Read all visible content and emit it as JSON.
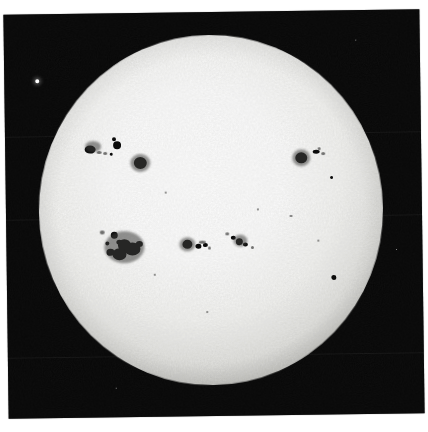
{
  "image": {
    "kind": "photograph",
    "subject": "full solar disk",
    "medium": "black-and-white photographic print",
    "width": 428,
    "height": 432,
    "background_color": "#ffffff",
    "print_color": "#050505",
    "disk_color": "#fbfbf9",
    "spot_color": "#0b0b0b"
  },
  "print": {
    "left": 6,
    "top": 12,
    "width": 416,
    "height": 404,
    "rotation_deg": -0.75,
    "seams": [
      122,
      205,
      343
    ]
  },
  "disk": {
    "center_x": 205,
    "center_y": 198,
    "radius_x": 172,
    "radius_y": 175
  },
  "field_marks": {
    "fiducial": {
      "x": 33,
      "y": 67,
      "label": "bright-reference-point"
    },
    "specks": [
      {
        "x": 352,
        "y": 30
      },
      {
        "x": 390,
        "y": 240
      },
      {
        "x": 108,
        "y": 375
      },
      {
        "x": 60,
        "y": 200
      }
    ]
  },
  "sunspots": {
    "groups": [
      {
        "name": "northwest-group",
        "spots": [
          {
            "x": 85,
            "y": 136,
            "w": 11,
            "h": 8,
            "type": "umbra"
          },
          {
            "x": 94,
            "y": 139,
            "w": 5,
            "h": 3,
            "type": "faint"
          },
          {
            "x": 100,
            "y": 140,
            "w": 4,
            "h": 3,
            "type": "faint"
          },
          {
            "x": 106,
            "y": 141,
            "w": 3,
            "h": 3,
            "type": "umbra"
          },
          {
            "x": 112,
            "y": 132,
            "w": 8,
            "h": 8,
            "type": "umbra"
          },
          {
            "x": 109,
            "y": 126,
            "w": 4,
            "h": 4,
            "type": "umbra"
          },
          {
            "x": 88,
            "y": 133,
            "w": 16,
            "h": 11,
            "type": "penumbra"
          },
          {
            "x": 135,
            "y": 150,
            "w": 13,
            "h": 12,
            "type": "umbra"
          },
          {
            "x": 135,
            "y": 150,
            "w": 20,
            "h": 18,
            "type": "penumbra"
          }
        ]
      },
      {
        "name": "northeast-group",
        "spots": [
          {
            "x": 296,
            "y": 147,
            "w": 12,
            "h": 11,
            "type": "umbra"
          },
          {
            "x": 296,
            "y": 147,
            "w": 18,
            "h": 17,
            "type": "penumbra"
          },
          {
            "x": 311,
            "y": 141,
            "w": 7,
            "h": 4,
            "type": "umbra"
          },
          {
            "x": 318,
            "y": 143,
            "w": 4,
            "h": 3,
            "type": "faint"
          },
          {
            "x": 314,
            "y": 138,
            "w": 3,
            "h": 3,
            "type": "faint"
          },
          {
            "x": 326,
            "y": 167,
            "w": 3,
            "h": 3,
            "type": "umbra"
          }
        ]
      },
      {
        "name": "southwest-large-group",
        "spots": [
          {
            "x": 108,
            "y": 222,
            "w": 7,
            "h": 7,
            "type": "umbra"
          },
          {
            "x": 113,
            "y": 229,
            "w": 6,
            "h": 5,
            "type": "umbra"
          },
          {
            "x": 101,
            "y": 230,
            "w": 4,
            "h": 4,
            "type": "umbra"
          },
          {
            "x": 118,
            "y": 232,
            "w": 13,
            "h": 12,
            "type": "umbra"
          },
          {
            "x": 126,
            "y": 236,
            "w": 16,
            "h": 13,
            "type": "umbra"
          },
          {
            "x": 113,
            "y": 241,
            "w": 14,
            "h": 12,
            "type": "umbra"
          },
          {
            "x": 104,
            "y": 239,
            "w": 8,
            "h": 7,
            "type": "umbra"
          },
          {
            "x": 133,
            "y": 231,
            "w": 7,
            "h": 6,
            "type": "umbra"
          },
          {
            "x": 118,
            "y": 234,
            "w": 40,
            "h": 32,
            "type": "penumbra"
          },
          {
            "x": 96,
            "y": 219,
            "w": 5,
            "h": 4,
            "type": "faint"
          }
        ]
      },
      {
        "name": "equatorial-group",
        "spots": [
          {
            "x": 181,
            "y": 232,
            "w": 10,
            "h": 9,
            "type": "umbra"
          },
          {
            "x": 181,
            "y": 232,
            "w": 16,
            "h": 14,
            "type": "penumbra"
          },
          {
            "x": 192,
            "y": 234,
            "w": 6,
            "h": 5,
            "type": "umbra"
          },
          {
            "x": 199,
            "y": 233,
            "w": 5,
            "h": 4,
            "type": "umbra"
          },
          {
            "x": 196,
            "y": 230,
            "w": 7,
            "h": 3,
            "type": "faint"
          },
          {
            "x": 203,
            "y": 236,
            "w": 3,
            "h": 3,
            "type": "faint"
          }
        ]
      },
      {
        "name": "central-east-group",
        "spots": [
          {
            "x": 227,
            "y": 226,
            "w": 5,
            "h": 4,
            "type": "umbra"
          },
          {
            "x": 233,
            "y": 230,
            "w": 7,
            "h": 7,
            "type": "umbra"
          },
          {
            "x": 239,
            "y": 233,
            "w": 5,
            "h": 4,
            "type": "umbra"
          },
          {
            "x": 221,
            "y": 222,
            "w": 4,
            "h": 3,
            "type": "faint"
          },
          {
            "x": 234,
            "y": 229,
            "w": 14,
            "h": 12,
            "type": "penumbra"
          },
          {
            "x": 246,
            "y": 236,
            "w": 3,
            "h": 3,
            "type": "faint"
          }
        ]
      },
      {
        "name": "scattered-pores",
        "spots": [
          {
            "x": 327,
            "y": 267,
            "w": 5,
            "h": 5,
            "type": "umbra"
          },
          {
            "x": 285,
            "y": 205,
            "w": 3,
            "h": 2,
            "type": "faint"
          },
          {
            "x": 160,
            "y": 180,
            "w": 2,
            "h": 2,
            "type": "faint"
          },
          {
            "x": 200,
            "y": 300,
            "w": 2,
            "h": 2,
            "type": "faint"
          },
          {
            "x": 252,
            "y": 198,
            "w": 2,
            "h": 2,
            "type": "faint"
          },
          {
            "x": 148,
            "y": 262,
            "w": 2,
            "h": 2,
            "type": "faint"
          },
          {
            "x": 312,
            "y": 230,
            "w": 2,
            "h": 2,
            "type": "faint"
          }
        ]
      }
    ]
  }
}
